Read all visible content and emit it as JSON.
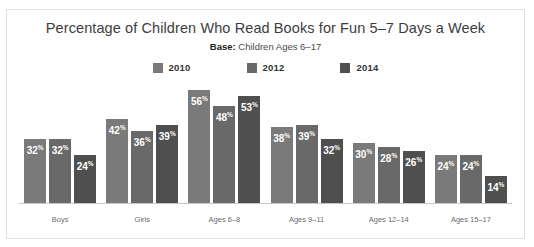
{
  "chart_data": {
    "type": "bar",
    "title": "Percentage of Children Who Read Books for Fun 5–7 Days a Week",
    "subtitle_strong": "Base:",
    "subtitle_rest": " Children Ages 6–17",
    "categories": [
      "Boys",
      "Girls",
      "Ages 6–8",
      "Ages 9–11",
      "Ages 12–14",
      "Ages 15–17"
    ],
    "series": [
      {
        "name": "2010",
        "color": "#7a7a7a",
        "values": [
          32,
          42,
          56,
          38,
          30,
          24
        ]
      },
      {
        "name": "2012",
        "color": "#696969",
        "values": [
          32,
          36,
          48,
          39,
          28,
          24
        ]
      },
      {
        "name": "2014",
        "color": "#4f4f4f",
        "values": [
          24,
          39,
          53,
          32,
          26,
          14
        ]
      }
    ],
    "value_suffix": "%",
    "xlabel": "",
    "ylabel": "",
    "ylim": [
      0,
      60
    ],
    "grid": false,
    "legend_position": "top-center",
    "axis_color": "#c8c8c8",
    "border_color": "#dedede",
    "label_color": "#6b6b6b",
    "value_label_color": "#ffffff"
  }
}
